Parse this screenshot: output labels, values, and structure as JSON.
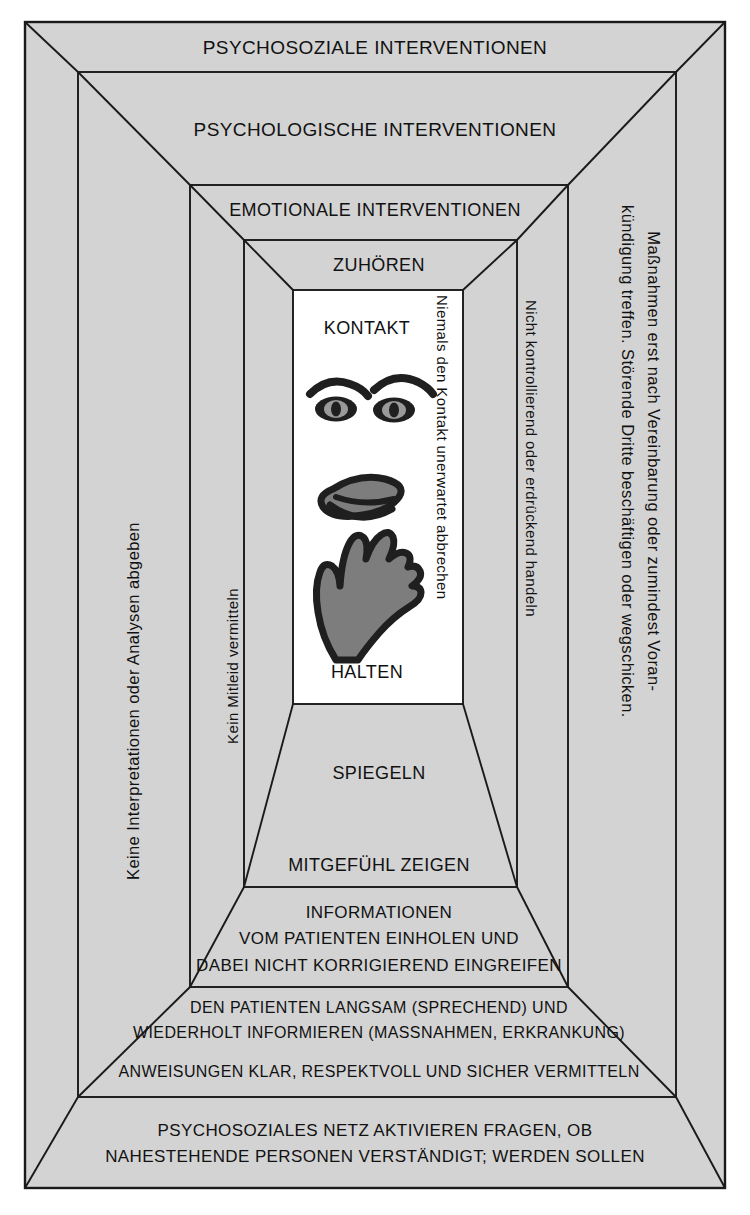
{
  "diagram": {
    "colors": {
      "band_fill": "#d3d3d3",
      "core_fill": "#ffffff",
      "line": "#1a1a1a",
      "text": "#111111",
      "face_ink": "#1f1f1f",
      "face_fill": "#808080"
    },
    "bands": {
      "outer_top": "PSYCHOSOZIALE INTERVENTIONEN",
      "second_top": "PSYCHOLOGISCHE INTERVENTIONEN",
      "third_top": "EMOTIONALE INTERVENTIONEN",
      "fourth_top": "ZUHÖREN",
      "fourth_bottom": "SPIEGELN",
      "third_bottom": "MITGEFÜHL ZEIGEN"
    },
    "core": {
      "top_label": "KONTAKT",
      "bottom_label": "HALTEN",
      "side_note": "Niemals den Kontakt unerwartet abbrechen",
      "illustration": "face-eyes-mouth-hand"
    },
    "sides": {
      "outer_left": "Keine Interpretationen oder Analysen abgeben",
      "outer_right": "Maßnahmen erst nach Vereinbarung oder zumindest Voran-\nkündigung treffen. Störende Dritte beschäftigen oder wegschicken.",
      "inner_left": "Kein Mitleid vermitteln",
      "inner_right": "Nicht kontrollierend oder erdrückend handeln"
    },
    "bottom_blocks": {
      "block_a": "INFORMATIONEN\nVOM PATIENTEN EINHOLEN UND\nDABEI NICHT KORRIGIEREND EINGREIFEN",
      "block_b": "DEN PATIENTEN LANGSAM (SPRECHEND) UND\nWIEDERHOLT INFORMIEREN (MASSNAHMEN, ERKRANKUNG)",
      "block_c": "ANWEISUNGEN KLAR, RESPEKTVOLL UND SICHER VERMITTELN",
      "block_d": "PSYCHOSOZIALES NETZ AKTIVIEREN FRAGEN, OB\nNAHESTEHENDE PERSONEN VERSTÄNDIGT; WERDEN SOLLEN"
    }
  }
}
